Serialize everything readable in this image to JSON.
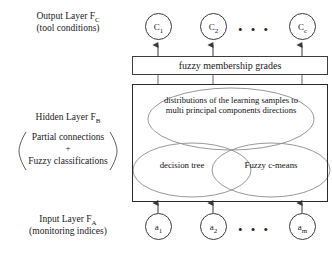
{
  "diagram": {
    "colors": {
      "background": "#ffffff",
      "box_stroke": "#2b2b2b",
      "node_stroke": "#3b3b3b",
      "ellipse_stroke": "#8a8a8a",
      "connector": "#555555",
      "text": "#1a1a1a"
    }
  },
  "labels": {
    "output_layer": {
      "line1_text": "Output Layer F",
      "line1_sub": "C",
      "line2": "(tool conditions)"
    },
    "hidden_layer": {
      "line1_text": "Hidden Layer F",
      "line1_sub": "B",
      "paren_line1": "Partial connections",
      "paren_line2": "+",
      "paren_line3": "Fuzzy classifications"
    },
    "input_layer": {
      "line1_text": "Input Layer F",
      "line1_sub": "A",
      "line2": "(monitoring indices)"
    }
  },
  "output_nodes": [
    {
      "name": "output-node-c1",
      "base": "C",
      "sub": "1"
    },
    {
      "name": "output-node-c2",
      "base": "C",
      "sub": "2"
    },
    {
      "name": "output-node-cc",
      "base": "C",
      "sub": "c"
    }
  ],
  "input_nodes": [
    {
      "name": "input-node-a1",
      "base": "a",
      "sub": "1"
    },
    {
      "name": "input-node-a2",
      "base": "a",
      "sub": "2"
    },
    {
      "name": "input-node-am",
      "base": "a",
      "sub": "m"
    }
  ],
  "ellipsis": {
    "output": "• • •",
    "input": "• • •"
  },
  "fuzzy_bar": {
    "label": "fuzzy membership grades"
  },
  "hidden_box": {
    "ellipse_top": {
      "line1": "distributions of the learning",
      "line2": "samples to multi principal",
      "line3": "components directions"
    },
    "ellipse_left": {
      "label": "decision tree"
    },
    "ellipse_right": {
      "label": "Fuzzy c-means"
    }
  }
}
